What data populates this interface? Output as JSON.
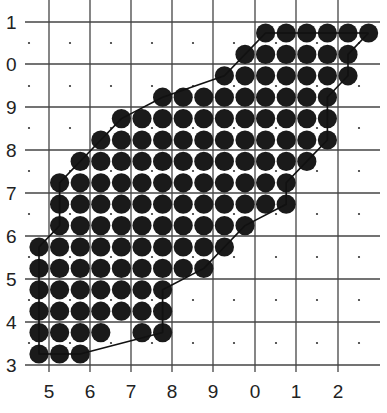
{
  "diagram": {
    "type": "dot-grid-region",
    "y_axis": {
      "labels": [
        "1",
        "0",
        "9",
        "8",
        "7",
        "6",
        "5",
        "4",
        "3"
      ],
      "gridlines_y": [
        22,
        64,
        107,
        150,
        193,
        236,
        279,
        322,
        365
      ]
    },
    "x_axis": {
      "labels": [
        "5",
        "6",
        "7",
        "8",
        "9",
        "0",
        "1",
        "2"
      ],
      "gridlines_x": [
        49,
        90,
        131,
        172,
        213,
        255,
        296,
        338
      ]
    },
    "grid_bounds": {
      "left": 25,
      "right": 380,
      "top": 0,
      "bottom": 372
    },
    "cell_center_dots": {
      "xs": [
        29,
        70,
        111,
        152,
        193,
        234,
        276,
        317,
        359
      ],
      "ys": [
        43,
        86,
        128,
        171,
        214,
        257,
        300,
        343
      ],
      "color": "#333333"
    },
    "circle_lattice": {
      "x0": 39,
      "dx": 20.6,
      "y0": 33,
      "dy": 21.4,
      "radius": 9.6,
      "color": "#1a1a1a",
      "rows": [
        [
          [
            11,
            16
          ]
        ],
        [
          [
            10,
            15
          ]
        ],
        [
          [
            9,
            15
          ]
        ],
        [
          [
            6,
            14
          ]
        ],
        [
          [
            4,
            14
          ]
        ],
        [
          [
            3,
            14
          ]
        ],
        [
          [
            2,
            13
          ]
        ],
        [
          [
            1,
            12
          ]
        ],
        [
          [
            1,
            12
          ]
        ],
        [
          [
            1,
            10
          ]
        ],
        [
          [
            0,
            9
          ]
        ],
        [
          [
            0,
            8
          ]
        ],
        [
          [
            0,
            6
          ]
        ],
        [
          [
            0,
            6
          ]
        ],
        [
          [
            0,
            3
          ],
          [
            5,
            6
          ]
        ],
        [
          [
            0,
            2
          ]
        ]
      ]
    },
    "colors": {
      "background": "#ffffff",
      "gridline": "#444444",
      "label": "#222222",
      "outline": "#111111"
    }
  }
}
